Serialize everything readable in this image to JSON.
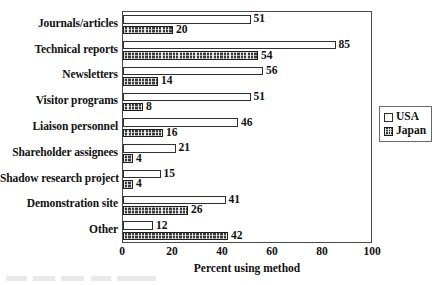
{
  "chart_data": {
    "type": "bar",
    "orientation": "horizontal",
    "title": "",
    "xlabel": "Percent using method",
    "ylabel": "",
    "xlim": [
      0,
      100
    ],
    "xticks": [
      "0",
      "20",
      "40",
      "60",
      "80",
      "100"
    ],
    "grid": false,
    "legend_position": "inside-upper-right",
    "categories": [
      "Journals/articles",
      "Technical reports",
      "Newsletters",
      "Visitor programs",
      "Liaison personnel",
      "Shareholder assignees",
      "Shadow research project",
      "Demonstration site",
      "Other"
    ],
    "series": [
      {
        "name": "USA",
        "style": "hollow-white",
        "values": [
          51,
          85,
          56,
          51,
          46,
          21,
          15,
          41,
          12
        ]
      },
      {
        "name": "Japan",
        "style": "dark-dotted",
        "values": [
          20,
          54,
          14,
          8,
          16,
          4,
          4,
          26,
          42
        ]
      }
    ]
  },
  "legend": {
    "items": [
      {
        "label": "USA",
        "swatch": "usa-swatch-icon"
      },
      {
        "label": "Japan",
        "swatch": "japan-swatch-icon"
      }
    ]
  }
}
